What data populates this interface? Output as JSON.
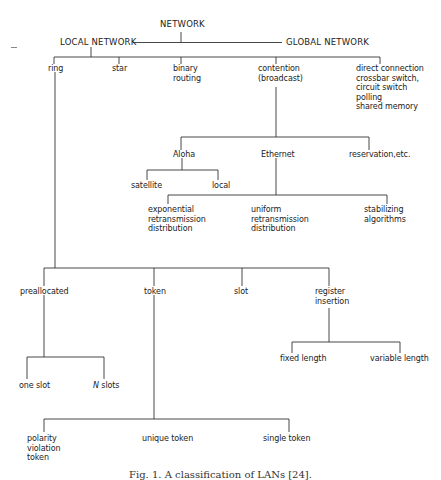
{
  "figure": {
    "root": "NETWORK",
    "level1": {
      "local": "LOCAL NETWORK",
      "global": "GLOBAL NETWORK"
    },
    "local_types": {
      "ring": "ring",
      "star": "star",
      "binary": "binary\nrouting",
      "contention": "contention\n(broadcast)",
      "direct": "direct connection\ncrossbar switch,\ncircuit switch\npolling\nshared memory"
    },
    "contention_types": {
      "aloha": "Aloha",
      "ethernet": "Ethernet",
      "reservation": "reservation,etc."
    },
    "aloha_types": {
      "satellite": "satellite",
      "local": "local"
    },
    "ethernet_types": {
      "exponential": "exponential\nretransmission\ndistribution",
      "uniform": "uniform\nretransmission\ndistribution",
      "stabilizing": "stabilizing\nalgorithms"
    },
    "ring_types": {
      "preallocated": "preallocated",
      "token": "token",
      "slot": "slot",
      "register": "register\ninsertion"
    },
    "preallocated_types": {
      "one_slot": "one slot",
      "n_slots_italic": "N",
      "n_slots_rest": " slots"
    },
    "register_types": {
      "fixed": "fixed length",
      "variable": "variable length"
    },
    "token_types": {
      "polarity": "polarity\nviolation\ntoken",
      "unique": "unique token",
      "single": "single token"
    },
    "caption": "Fig. 1. A classification of LANs [24]."
  }
}
